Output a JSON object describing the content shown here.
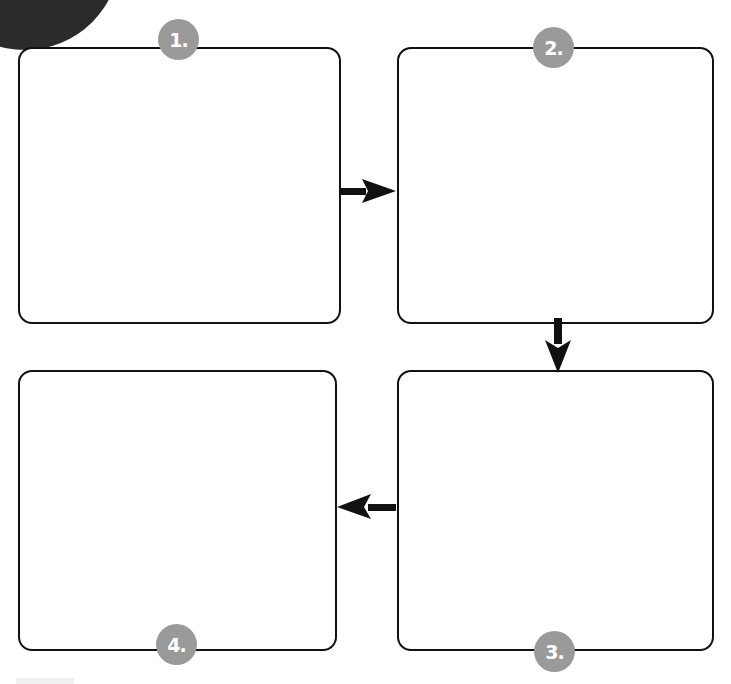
{
  "diagram": {
    "type": "four-step cyclic flow",
    "steps": [
      {
        "id": 1,
        "label": "1.",
        "content": ""
      },
      {
        "id": 2,
        "label": "2.",
        "content": ""
      },
      {
        "id": 3,
        "label": "3.",
        "content": ""
      },
      {
        "id": 4,
        "label": "4.",
        "content": ""
      }
    ],
    "connections": [
      {
        "from": 1,
        "to": 2,
        "direction": "right"
      },
      {
        "from": 2,
        "to": 3,
        "direction": "down"
      },
      {
        "from": 3,
        "to": 4,
        "direction": "left"
      }
    ],
    "colors": {
      "border": "#111111",
      "badge": "#9a9a9a",
      "badge_text": "#ffffff",
      "arrow": "#111111",
      "corner_decoration": "#2b2b2b"
    }
  }
}
